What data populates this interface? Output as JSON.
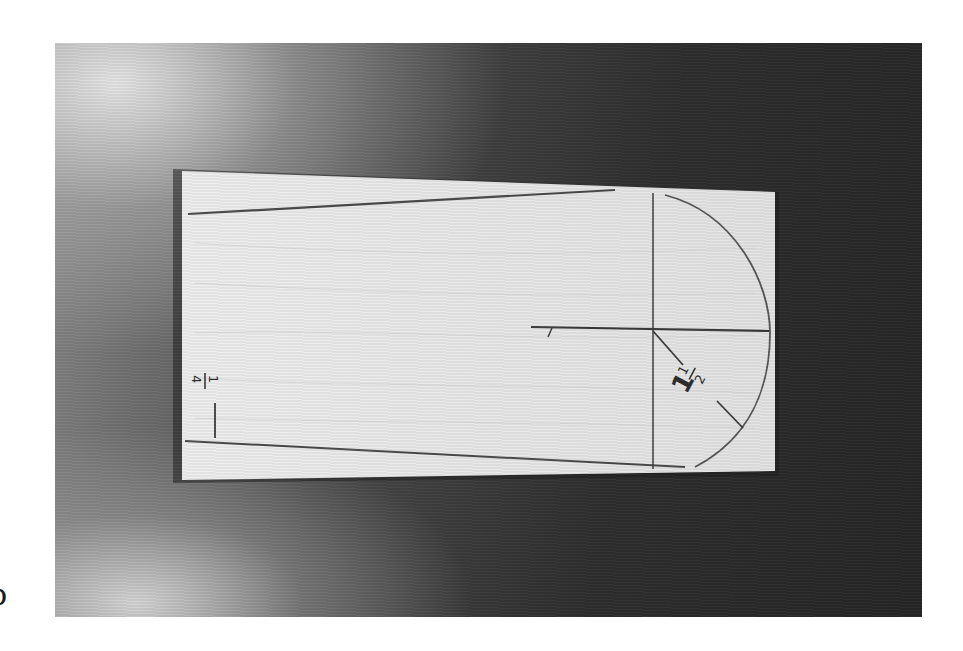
{
  "image": {
    "description": "Grayscale photograph of a rectangular wooden board with pencil layout lines for a tapered piece with a rounded end",
    "background": {
      "surface": "dark textured wood/fabric backdrop with bright highlight at upper-left",
      "colors": {
        "highlight": "#e0e0e0",
        "mid": "#5a5a5a",
        "dark": "#262626"
      }
    },
    "board": {
      "color": "#ececec",
      "grain": "faint horizontal wood grain"
    },
    "markings": {
      "radius_label": "1½",
      "radius_label_parts": {
        "whole": "1",
        "numerator": "1",
        "denominator": "2"
      },
      "edge_label": "¼",
      "edge_label_parts": {
        "numerator": "1",
        "denominator": "4"
      },
      "lines": [
        "top taper line",
        "bottom taper line",
        "vertical centerline through arc center",
        "horizontal centerline",
        "radius line from center to arc",
        "semicircular end arc"
      ]
    },
    "margin_glyph": "b"
  }
}
